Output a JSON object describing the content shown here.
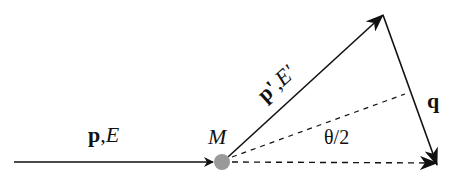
{
  "diagram": {
    "type": "scattering-kinematics",
    "incoming": {
      "momentum": "p",
      "sep": ",",
      "energy": "E"
    },
    "outgoing": {
      "momentum": "p'",
      "sep": ",",
      "energy": "E'"
    },
    "transfer": {
      "label": "q"
    },
    "target": {
      "label": "M",
      "color": "#9a9a9a"
    },
    "angle": {
      "label": "θ/2"
    },
    "colors": {
      "line": "#111111",
      "target": "#9a9a9a"
    }
  }
}
